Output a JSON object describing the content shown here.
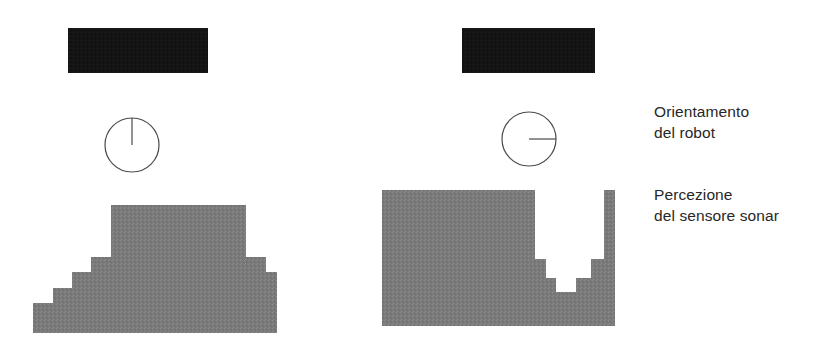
{
  "figure": {
    "background_color": "#ffffff",
    "obstacle_color": "#141414",
    "perception_color": "#7b7b7b",
    "robot_outline_color": "#4a4a4a",
    "text_color": "#272727"
  },
  "legend": {
    "orientation": {
      "line1": "Orientamento",
      "line2": "del robot"
    },
    "perception": {
      "line1": "Percezione",
      "line2": "del sensore sonar"
    }
  },
  "panels": [
    {
      "id": "panel-left",
      "obstacle": {
        "x": 68,
        "y": 28,
        "width": 140,
        "height": 45
      },
      "robot": {
        "cx": 132,
        "cy": 145,
        "r": 27,
        "heading": "up",
        "heading_degrees": 90
      },
      "perception_outline": "33,333 33,303 53,303 53,288 72,288 72,272 91,272 91,257 111,257 111,205 246,205 246,257 266,257 266,272 277,272 277,333"
    },
    {
      "id": "panel-right",
      "obstacle": {
        "x": 462,
        "y": 28,
        "width": 133,
        "height": 45
      },
      "robot": {
        "cx": 529,
        "cy": 139,
        "r": 27,
        "heading": "right",
        "heading_degrees": 0
      },
      "perception_outline": "382,326 382,190 535,190 535,259 546,259 546,278 556,278 556,292 576,292 576,278 591,278 591,259 604,259 604,190 615,190 615,326"
    }
  ],
  "chart_data": {
    "type": "diagram",
    "title": "",
    "series": [
      {
        "name": "panel-left",
        "robot_heading_degrees": 90,
        "obstacle": {
          "x": 68,
          "y": 28,
          "width": 140,
          "height": 45
        },
        "perception_steps": [
          {
            "x": 33,
            "width": 20,
            "top": 303
          },
          {
            "x": 53,
            "width": 19,
            "top": 288
          },
          {
            "x": 72,
            "width": 19,
            "top": 272
          },
          {
            "x": 91,
            "width": 20,
            "top": 257
          },
          {
            "x": 111,
            "width": 135,
            "top": 205
          },
          {
            "x": 246,
            "width": 20,
            "top": 257
          },
          {
            "x": 266,
            "width": 11,
            "top": 272
          }
        ],
        "baseline_y": 333
      },
      {
        "name": "panel-right",
        "robot_heading_degrees": 0,
        "obstacle": {
          "x": 462,
          "y": 28,
          "width": 133,
          "height": 45
        },
        "perception_steps": [
          {
            "x": 382,
            "width": 153,
            "top": 190
          },
          {
            "x": 535,
            "width": 11,
            "top": 259
          },
          {
            "x": 546,
            "width": 10,
            "top": 278
          },
          {
            "x": 556,
            "width": 20,
            "top": 292
          },
          {
            "x": 576,
            "width": 15,
            "top": 278
          },
          {
            "x": 591,
            "width": 13,
            "top": 259
          },
          {
            "x": 604,
            "width": 11,
            "top": 190
          }
        ],
        "baseline_y": 326
      }
    ],
    "annotations": [
      {
        "text": "Orientamento del robot",
        "x": 654,
        "y": 101
      },
      {
        "text": "Percezione del sensore sonar",
        "x": 654,
        "y": 184
      }
    ]
  }
}
